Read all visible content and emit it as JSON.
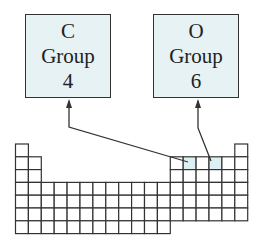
{
  "boxes": [
    {
      "symbol": "C",
      "label": "Group",
      "group": "4",
      "left": 25,
      "highlight_cell": {
        "col": 14,
        "row": 2
      }
    },
    {
      "symbol": "O",
      "label": "Group",
      "group": "6",
      "left": 153,
      "highlight_cell": {
        "col": 16,
        "row": 2
      }
    }
  ],
  "colors": {
    "box_fill": "#e6f2f4",
    "line": "#333333",
    "highlight": "#dceff3"
  },
  "periodic_table": {
    "columns": 18,
    "rows": 7
  }
}
